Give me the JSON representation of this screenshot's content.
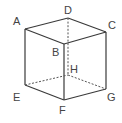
{
  "diagram": {
    "type": "cube",
    "vertices": {
      "A": {
        "label": "A",
        "x": 25,
        "y": 29,
        "lx": 13,
        "ly": 25
      },
      "B": {
        "label": "B",
        "x": 64,
        "y": 44,
        "lx": 52,
        "ly": 56
      },
      "C": {
        "label": "C",
        "x": 106,
        "y": 32,
        "lx": 108,
        "ly": 29
      },
      "D": {
        "label": "D",
        "x": 68,
        "y": 18,
        "lx": 64,
        "ly": 14
      },
      "E": {
        "label": "E",
        "x": 25,
        "y": 85,
        "lx": 13,
        "ly": 101
      },
      "F": {
        "label": "F",
        "x": 64,
        "y": 100,
        "lx": 59,
        "ly": 114
      },
      "G": {
        "label": "G",
        "x": 106,
        "y": 89,
        "lx": 107,
        "ly": 101
      },
      "H": {
        "label": "H",
        "x": 68,
        "y": 75,
        "lx": 70,
        "ly": 73
      }
    },
    "solid_edges": [
      [
        "A",
        "B"
      ],
      [
        "B",
        "C"
      ],
      [
        "C",
        "D"
      ],
      [
        "D",
        "A"
      ],
      [
        "A",
        "E"
      ],
      [
        "B",
        "F"
      ],
      [
        "C",
        "G"
      ],
      [
        "E",
        "F"
      ],
      [
        "F",
        "G"
      ]
    ],
    "hidden_edges": [
      [
        "D",
        "H"
      ],
      [
        "E",
        "H"
      ],
      [
        "H",
        "G"
      ]
    ],
    "colors": {
      "line": "#3a3a3a",
      "label": "#444444"
    }
  }
}
